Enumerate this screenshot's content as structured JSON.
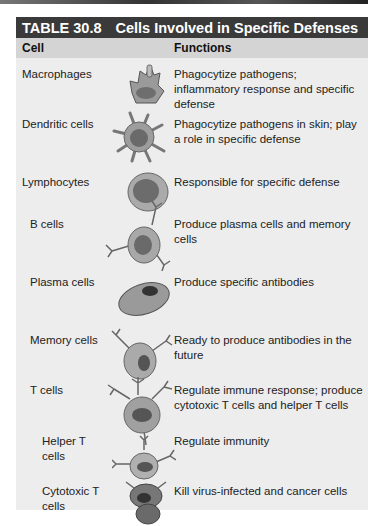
{
  "table": {
    "number": "TABLE 30.8",
    "title": "Cells Involved in Specific Defenses",
    "headers": {
      "cell": "Cell",
      "functions": "Functions"
    },
    "rows": [
      {
        "cell": "Macrophages",
        "function": "Phagocytize pathogens; inflammatory response and specific defense",
        "icon": "macrophage-icon"
      },
      {
        "cell": "Dendritic cells",
        "function": "Phagocytize pathogens in skin; play a role in specific defense",
        "icon": "dendritic-cell-icon"
      },
      {
        "cell": "Lymphocytes",
        "function": "Responsible for specific defense",
        "icon": "lymphocyte-icon"
      },
      {
        "cell": "B cells",
        "function": "Produce plasma cells and memory cells",
        "icon": "b-cell-icon"
      },
      {
        "cell": "Plasma cells",
        "function": "Produce specific antibodies",
        "icon": "plasma-cell-icon"
      },
      {
        "cell": "Memory cells",
        "function": "Ready to produce antibodies in the future",
        "icon": "memory-cell-icon"
      },
      {
        "cell": "T cells",
        "function": "Regulate immune response; produce cytotoxic T cells and helper T cells",
        "icon": "t-cell-icon"
      },
      {
        "cell": "Helper T cells",
        "function": "Regulate immunity",
        "icon": "helper-t-cell-icon"
      },
      {
        "cell": "Cytotoxic T cells",
        "function": "Kill virus-infected and cancer cells",
        "icon": "cytotoxic-t-cell-icon"
      }
    ]
  }
}
